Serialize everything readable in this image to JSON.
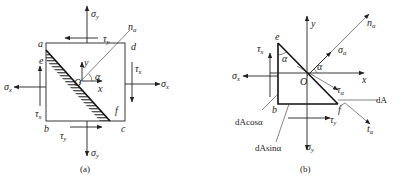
{
  "figure": {
    "panels": [
      {
        "id": "a",
        "caption": "(a)",
        "points": {
          "a": "a",
          "b": "b",
          "c": "c",
          "d": "d",
          "e": "e",
          "f": "f",
          "origin": "O"
        },
        "axes": {
          "x": "x",
          "y": "y",
          "normal": "n",
          "normal_sub": "α",
          "angle": "α"
        },
        "stresses": {
          "sigma_x": {
            "sym": "σ",
            "sub": "x"
          },
          "sigma_y": {
            "sym": "σ",
            "sub": "y"
          },
          "tau_x": {
            "sym": "τ",
            "sub": "x"
          },
          "tau_y": {
            "sym": "τ",
            "sub": "y"
          }
        }
      },
      {
        "id": "b",
        "caption": "(b)",
        "points": {
          "e": "e",
          "b": "b",
          "f": "f",
          "origin": "O"
        },
        "axes": {
          "x": "x",
          "y": "y",
          "normal": "n",
          "normal_sub": "α",
          "tangent": "t",
          "tangent_sub": "α",
          "angle": "α"
        },
        "stresses": {
          "sigma_x": {
            "sym": "σ",
            "sub": "x"
          },
          "sigma_y": {
            "sym": "σ",
            "sub": "y"
          },
          "tau_x": {
            "sym": "τ",
            "sub": "x"
          },
          "tau_y": {
            "sym": "τ",
            "sub": "y"
          },
          "sigma_alpha": {
            "sym": "σ",
            "sub": "α"
          },
          "tau_alpha": {
            "sym": "τ",
            "sub": "α"
          }
        },
        "areas": {
          "dA": "dA",
          "dA_cos": "dAcosα",
          "dA_sin": "dAsinα"
        }
      }
    ]
  }
}
